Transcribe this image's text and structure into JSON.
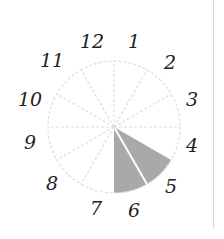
{
  "dial": {
    "center": [
      114,
      127
    ],
    "radius": 66,
    "sectors": 12,
    "labels": [
      "12",
      "1",
      "2",
      "3",
      "4",
      "5",
      "6",
      "7",
      "8",
      "9",
      "10",
      "11"
    ],
    "shaded_sectors": [
      {
        "from_hour": 4,
        "to_hour": 5
      },
      {
        "from_hour": 5,
        "to_hour": 6
      }
    ],
    "colors": {
      "shade": "#a9a9a9",
      "grid": "#dedede",
      "label": "#222222",
      "rule": "#d4d4d4"
    }
  }
}
